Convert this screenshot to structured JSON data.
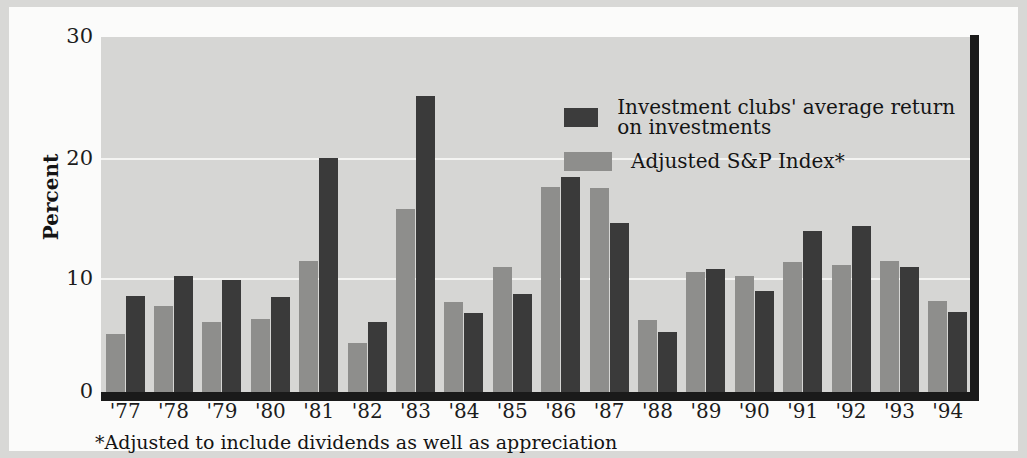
{
  "chart_data": {
    "type": "bar",
    "title": "",
    "xlabel": "",
    "ylabel": "Percent",
    "ylim": [
      0,
      30
    ],
    "yticks": [
      0,
      10,
      20,
      30
    ],
    "ytick_labels": [
      "0",
      "10",
      "20",
      "30"
    ],
    "grid": true,
    "legend_position": "inside-top-center",
    "categories": [
      "'77",
      "'78",
      "'79",
      "'80",
      "'81",
      "'82",
      "'83",
      "'84",
      "'85",
      "'86",
      "'87",
      "'88",
      "'89",
      "'90",
      "'91",
      "'92",
      "'93",
      "'94"
    ],
    "series": [
      {
        "name": "Adjusted S&P Index*",
        "color": "#8e8e8c",
        "values": [
          4.9,
          7.3,
          5.9,
          6.2,
          11.1,
          4.1,
          15.5,
          7.6,
          10.6,
          17.3,
          17.2,
          6.1,
          10.1,
          9.8,
          11.0,
          10.7,
          11.1,
          7.7
        ]
      },
      {
        "name": "Investment clubs' average return on investments",
        "color": "#3a3a3a",
        "values": [
          8.1,
          9.8,
          9.5,
          8.0,
          19.8,
          5.9,
          25.0,
          6.7,
          8.3,
          18.2,
          14.3,
          5.1,
          10.4,
          8.5,
          13.6,
          14.0,
          10.6,
          6.8
        ]
      }
    ],
    "annotations": [
      "*Adjusted to include dividends as well as appreciation"
    ]
  },
  "legend": {
    "items": [
      {
        "label": "Investment clubs' average return on investments",
        "swatch": "clubs"
      },
      {
        "label": "Adjusted S&P Index*",
        "swatch": "sp"
      }
    ]
  },
  "axes": {
    "y_label": "Percent",
    "y_tick_30": "30",
    "y_tick_20": "20",
    "y_tick_10": "10",
    "y_tick_0": "0"
  },
  "footnote": "*Adjusted to include dividends as well as appreciation"
}
